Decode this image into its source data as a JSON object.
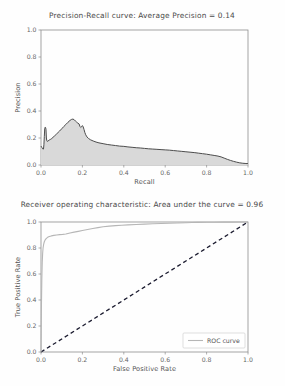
{
  "page": {
    "background_color": "#fefefe",
    "width": 285,
    "height": 386
  },
  "figures": [
    {
      "id": "precision-recall",
      "title": "Precision-Recall curve: Average Precision =    0.14"
    },
    {
      "id": "roc",
      "title": "Receiver operating characteristic:     Area under the curve = 0.96"
    }
  ],
  "chart_data": [
    {
      "type": "area",
      "id": "precision-recall",
      "title": "Precision-Recall curve: Average Precision =    0.14",
      "xlabel": "Recall",
      "ylabel": "Precision",
      "xlim": [
        0.0,
        1.0
      ],
      "ylim": [
        0.0,
        1.0
      ],
      "xticks": [
        0.0,
        0.2,
        0.4,
        0.6,
        0.8,
        1.0
      ],
      "xticklabels": [
        "0.0",
        "0.2",
        "0.4",
        "0.6",
        "0.8",
        "1.0"
      ],
      "yticks": [
        0.0,
        0.2,
        0.4,
        0.6,
        0.8,
        1.0
      ],
      "yticklabels": [
        "0.0",
        "0.2",
        "0.4",
        "0.6",
        "0.8",
        "1.0"
      ],
      "grid": false,
      "legend": null,
      "average_precision": 0.14,
      "line_color": "#4d4d4d",
      "fill_color": "#d9d9d9",
      "series": [
        {
          "name": "Precision-Recall",
          "x": [
            0.0,
            0.004,
            0.008,
            0.012,
            0.014,
            0.016,
            0.018,
            0.02,
            0.022,
            0.024,
            0.026,
            0.028,
            0.03,
            0.034,
            0.04,
            0.046,
            0.052,
            0.058,
            0.066,
            0.074,
            0.082,
            0.09,
            0.1,
            0.11,
            0.12,
            0.13,
            0.14,
            0.148,
            0.154,
            0.16,
            0.166,
            0.172,
            0.178,
            0.184,
            0.188,
            0.192,
            0.196,
            0.2,
            0.204,
            0.208,
            0.212,
            0.216,
            0.222,
            0.23,
            0.24,
            0.252,
            0.266,
            0.28,
            0.3,
            0.32,
            0.34,
            0.36,
            0.38,
            0.4,
            0.42,
            0.44,
            0.46,
            0.48,
            0.5,
            0.52,
            0.54,
            0.56,
            0.58,
            0.6,
            0.62,
            0.64,
            0.66,
            0.68,
            0.7,
            0.72,
            0.74,
            0.76,
            0.78,
            0.8,
            0.82,
            0.84,
            0.855,
            0.87,
            0.885,
            0.9,
            0.915,
            0.93,
            0.945,
            0.96,
            0.975,
            0.99,
            1.0
          ],
          "y": [
            0.14,
            0.13,
            0.12,
            0.118,
            0.15,
            0.21,
            0.27,
            0.28,
            0.278,
            0.265,
            0.2,
            0.18,
            0.175,
            0.178,
            0.185,
            0.19,
            0.196,
            0.205,
            0.216,
            0.228,
            0.24,
            0.252,
            0.268,
            0.285,
            0.3,
            0.316,
            0.33,
            0.338,
            0.34,
            0.336,
            0.326,
            0.318,
            0.31,
            0.304,
            0.286,
            0.278,
            0.284,
            0.292,
            0.282,
            0.262,
            0.24,
            0.224,
            0.208,
            0.196,
            0.186,
            0.178,
            0.17,
            0.164,
            0.158,
            0.152,
            0.148,
            0.144,
            0.14,
            0.138,
            0.134,
            0.131,
            0.128,
            0.126,
            0.123,
            0.12,
            0.118,
            0.116,
            0.114,
            0.112,
            0.11,
            0.107,
            0.104,
            0.101,
            0.098,
            0.095,
            0.092,
            0.088,
            0.084,
            0.08,
            0.075,
            0.07,
            0.066,
            0.06,
            0.051,
            0.042,
            0.034,
            0.027,
            0.021,
            0.016,
            0.013,
            0.011,
            0.01
          ]
        }
      ]
    },
    {
      "type": "line",
      "id": "roc",
      "title": "Receiver operating characteristic:     Area under the curve = 0.96",
      "xlabel": "False Positive Rate",
      "ylabel": "True Positive Rate",
      "xlim": [
        0.0,
        1.0
      ],
      "ylim": [
        0.0,
        1.0
      ],
      "xticks": [
        0.0,
        0.2,
        0.4,
        0.6,
        0.8,
        1.0
      ],
      "xticklabels": [
        "0.0",
        "0.2",
        "0.4",
        "0.6",
        "0.8",
        "1.0"
      ],
      "yticks": [
        0.0,
        0.2,
        0.4,
        0.6,
        0.8,
        1.0
      ],
      "yticklabels": [
        "0.0",
        "0.2",
        "0.4",
        "0.6",
        "0.8",
        "1.0"
      ],
      "grid": false,
      "legend": {
        "position": "lower right",
        "entries": [
          "ROC curve"
        ]
      },
      "area_under_curve": 0.96,
      "roc_color": "#b6b6b6",
      "chance_color": "#1b1b2f",
      "series": [
        {
          "name": "ROC curve",
          "x": [
            0.0,
            0.002,
            0.004,
            0.006,
            0.008,
            0.01,
            0.013,
            0.016,
            0.02,
            0.026,
            0.032,
            0.04,
            0.05,
            0.062,
            0.076,
            0.09,
            0.105,
            0.12,
            0.14,
            0.16,
            0.18,
            0.2,
            0.225,
            0.25,
            0.275,
            0.3,
            0.33,
            0.36,
            0.39,
            0.42,
            0.46,
            0.5,
            0.54,
            0.58,
            0.62,
            0.66,
            0.7,
            0.73,
            0.76,
            0.8,
            0.84,
            0.88,
            0.92,
            0.96,
            1.0
          ],
          "y": [
            0.0,
            0.34,
            0.56,
            0.69,
            0.76,
            0.8,
            0.83,
            0.848,
            0.862,
            0.874,
            0.882,
            0.888,
            0.893,
            0.897,
            0.9,
            0.903,
            0.905,
            0.908,
            0.916,
            0.922,
            0.928,
            0.934,
            0.942,
            0.95,
            0.957,
            0.963,
            0.968,
            0.972,
            0.975,
            0.978,
            0.981,
            0.984,
            0.986,
            0.988,
            0.99,
            0.992,
            0.994,
            0.996,
            0.997,
            0.998,
            0.998,
            0.999,
            0.999,
            1.0,
            1.0
          ]
        },
        {
          "name": "chance",
          "x": [
            0.0,
            1.0
          ],
          "y": [
            0.0,
            1.0
          ]
        }
      ]
    }
  ]
}
